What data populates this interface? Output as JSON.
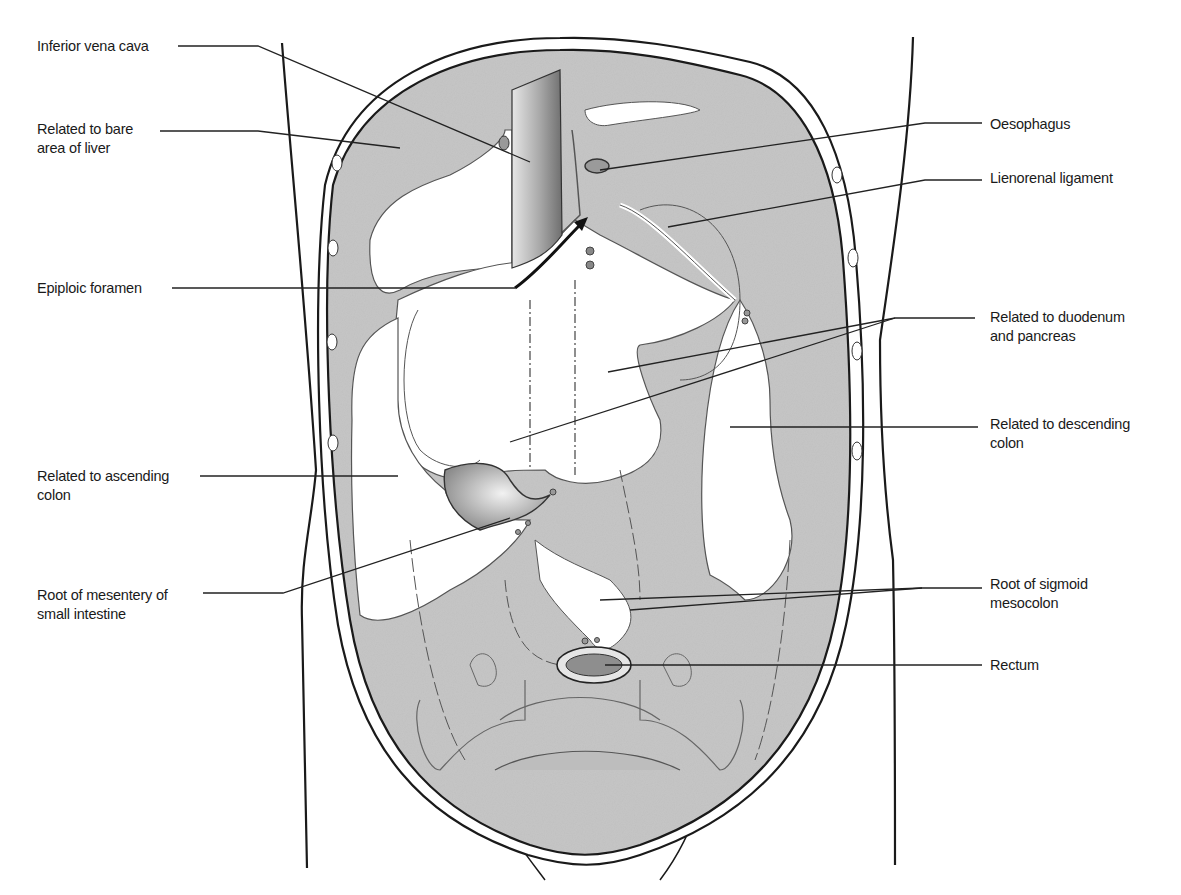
{
  "figure": {
    "colors": {
      "background": "#ffffff",
      "peritoneum_fill": "#c9c9c9",
      "peritoneum_dark": "#a9a9a9",
      "outline": "#1a1a1a",
      "leader_line": "#222222"
    },
    "labels_left": [
      {
        "id": "inferior-vena-cava",
        "text": "Inferior vena cava",
        "x": 37,
        "y": 37,
        "line": [
          [
            178,
            46
          ],
          [
            258,
            46
          ],
          [
            530,
            162
          ]
        ]
      },
      {
        "id": "bare-area-liver",
        "text": "Related to bare\narea of liver",
        "x": 37,
        "y": 120,
        "line": [
          [
            160,
            131
          ],
          [
            258,
            131
          ],
          [
            400,
            148
          ]
        ]
      },
      {
        "id": "epiploic-foramen",
        "text": "Epiploic foramen",
        "x": 37,
        "y": 279,
        "line": [
          [
            172,
            288
          ],
          [
            515,
            288
          ]
        ]
      },
      {
        "id": "ascending-colon",
        "text": "Related to ascending\ncolon",
        "x": 37,
        "y": 467,
        "line": [
          [
            200,
            476
          ],
          [
            398,
            476
          ]
        ]
      },
      {
        "id": "root-mesentery",
        "text": "Root of mesentery of\nsmall intestine",
        "x": 37,
        "y": 586,
        "line": [
          [
            203,
            593
          ],
          [
            283,
            593
          ],
          [
            510,
            518
          ]
        ]
      }
    ],
    "labels_right": [
      {
        "id": "oesophagus",
        "text": "Oesophagus",
        "x": 990,
        "y": 115,
        "line": [
          [
            982,
            123
          ],
          [
            925,
            123
          ],
          [
            600,
            170
          ]
        ]
      },
      {
        "id": "lienorenal-ligament",
        "text": "Lienorenal ligament",
        "x": 990,
        "y": 169,
        "line": [
          [
            982,
            180
          ],
          [
            925,
            180
          ],
          [
            668,
            227
          ]
        ]
      },
      {
        "id": "duodenum-pancreas",
        "text": "Related to duodenum\nand pancreas",
        "x": 990,
        "y": 308,
        "line": [
          [
            975,
            318
          ],
          [
            895,
            318
          ],
          [
            608,
            372
          ]
        ],
        "line2": [
          [
            895,
            318
          ],
          [
            510,
            442
          ]
        ]
      },
      {
        "id": "descending-colon",
        "text": "Related to descending\ncolon",
        "x": 990,
        "y": 415,
        "line": [
          [
            978,
            427
          ],
          [
            730,
            427
          ]
        ]
      },
      {
        "id": "root-sigmoid",
        "text": "Root of sigmoid\nmesocolon",
        "x": 990,
        "y": 575,
        "line": [
          [
            982,
            588
          ],
          [
            922,
            588
          ],
          [
            630,
            610
          ]
        ],
        "line2": [
          [
            922,
            588
          ],
          [
            600,
            600
          ]
        ]
      },
      {
        "id": "rectum",
        "text": "Rectum",
        "x": 990,
        "y": 656,
        "line": [
          [
            982,
            665
          ],
          [
            605,
            665
          ]
        ]
      }
    ],
    "caption": "Figure ... Posterior abdominal wall and the lines of peritoneal reflection (continued below)"
  }
}
